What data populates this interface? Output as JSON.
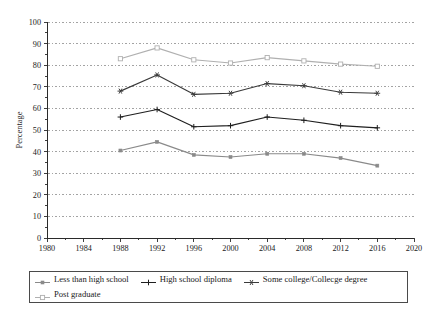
{
  "chart_data": {
    "type": "line",
    "title": "",
    "xlabel": "Election Year",
    "ylabel": "Percentage",
    "xlim": [
      1980,
      2020
    ],
    "ylim": [
      0,
      100
    ],
    "grid": true,
    "legend_position": "bottom",
    "x": [
      1988,
      1992,
      1996,
      2000,
      2004,
      2008,
      2012,
      2016
    ],
    "xticks": [
      "1980",
      "1984",
      "1988",
      "1992",
      "1996",
      "2000",
      "2004",
      "2008",
      "2012",
      "2016",
      "2020"
    ],
    "yticks": [
      "0",
      "10",
      "20",
      "30",
      "40",
      "50",
      "60",
      "70",
      "80",
      "90",
      "100"
    ],
    "series": [
      {
        "name": "Less than high school",
        "marker": "small-square",
        "color": "#8a8a8a",
        "values": [
          40.5,
          44.5,
          38.5,
          37.5,
          39.0,
          39.0,
          37.0,
          33.5
        ]
      },
      {
        "name": "High school diploma",
        "marker": "plus",
        "color": "#1f1f1f",
        "values": [
          56.0,
          59.5,
          51.5,
          52.0,
          56.0,
          54.5,
          52.0,
          51.0
        ]
      },
      {
        "name": "Some college/Collecge degree",
        "marker": "star",
        "color": "#3a3a3a",
        "values": [
          68.0,
          75.5,
          66.5,
          67.0,
          71.5,
          70.5,
          67.5,
          67.0
        ]
      },
      {
        "name": "Post graduate",
        "marker": "open-square",
        "color": "#b0b0b0",
        "values": [
          83.0,
          88.0,
          82.5,
          81.0,
          83.5,
          82.0,
          80.5,
          79.5
        ]
      }
    ]
  },
  "legend": {
    "entries": [
      {
        "label": "Less than high school",
        "marker": "small-square"
      },
      {
        "label": "High school diploma",
        "marker": "plus"
      },
      {
        "label": "Some college/Collecge degree",
        "marker": "star"
      },
      {
        "label": "Post graduate",
        "marker": "open-square"
      }
    ]
  }
}
